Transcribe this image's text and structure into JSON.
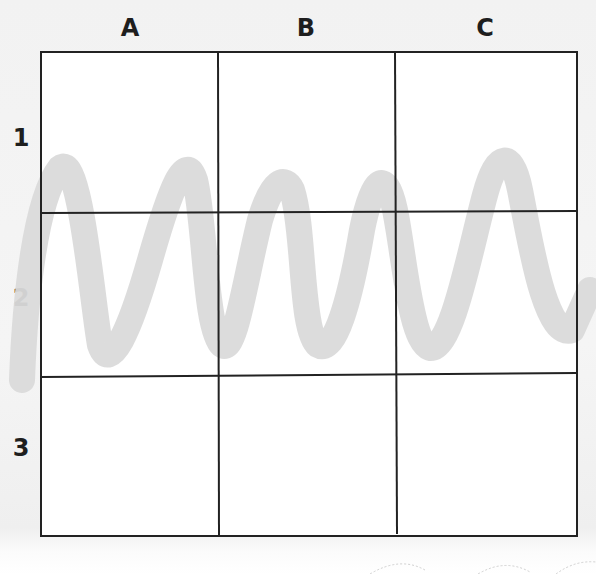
{
  "worksheet": {
    "columns": [
      {
        "label": "A"
      },
      {
        "label": "B"
      },
      {
        "label": "C"
      }
    ],
    "rows": [
      {
        "label": "1"
      },
      {
        "label": "2"
      },
      {
        "label": "3"
      }
    ],
    "grid": {
      "rows": 3,
      "cols": 3,
      "line_color": "#222222"
    },
    "squiggle": {
      "color": "#d9d9d9",
      "description": "gray wavy line crossing rows 1 and 2"
    }
  }
}
